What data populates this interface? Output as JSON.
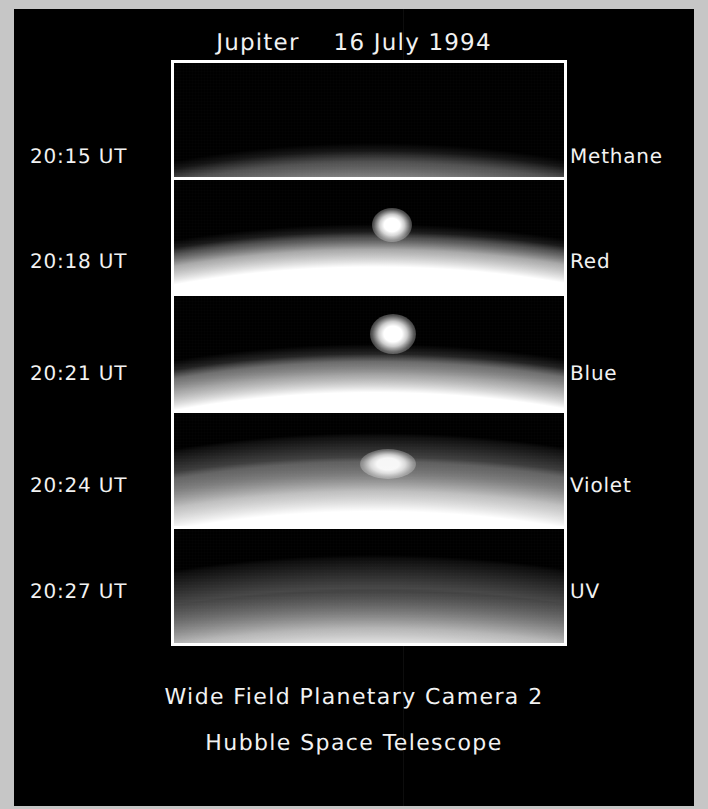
{
  "header": {
    "title": "Jupiter    16 July 1994"
  },
  "caption": {
    "line1": "Wide Field Planetary Camera 2",
    "line2": "Hubble Space Telescope"
  },
  "colors": {
    "background": "#000000",
    "scan_border": "#c6c6c6",
    "text": "#f2f2f2",
    "frame": "#ffffff"
  },
  "panels": [
    {
      "time": "20:15 UT",
      "filter": "Methane",
      "plume": false,
      "limb_brightness": "dim",
      "description": "Faint narrow limb arc, brightening toward the right edge; no impact plume visible."
    },
    {
      "time": "20:18 UT",
      "filter": "Red",
      "plume": true,
      "limb_brightness": "bright",
      "description": "Bright saturated limb with a compact, very bright impact plume above the limb, right of center."
    },
    {
      "time": "20:21 UT",
      "filter": "Blue",
      "plume": true,
      "limb_brightness": "bright",
      "description": "Bright saturated limb with a rounded bright impact plume above the limb, right of center."
    },
    {
      "time": "20:24 UT",
      "filter": "Violet",
      "plume": true,
      "limb_brightness": "hazy",
      "description": "Hazy, extended limb with a diffuse bright plume blended into the limb near center."
    },
    {
      "time": "20:27 UT",
      "filter": "UV",
      "plume": false,
      "limb_brightness": "hazy",
      "description": "Broad hazy limb gradient with no discrete plume remaining."
    }
  ]
}
